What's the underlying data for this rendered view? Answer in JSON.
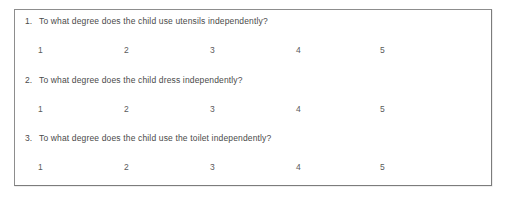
{
  "document": {
    "type": "questionnaire",
    "background_color": "#ffffff",
    "border_color": "#8d8d8d",
    "text_color": "#4a4a4a"
  },
  "questions": [
    {
      "number": "1.",
      "text": "To what degree does the child use utensils independently?",
      "scale": [
        "1",
        "2",
        "3",
        "4",
        "5"
      ]
    },
    {
      "number": "2.",
      "text": "To what degree does the child dress independently?",
      "scale": [
        "1",
        "2",
        "3",
        "4",
        "5"
      ]
    },
    {
      "number": "3.",
      "text": "To what degree does the child use the toilet independently?",
      "scale": [
        "1",
        "2",
        "3",
        "4",
        "5"
      ]
    }
  ]
}
